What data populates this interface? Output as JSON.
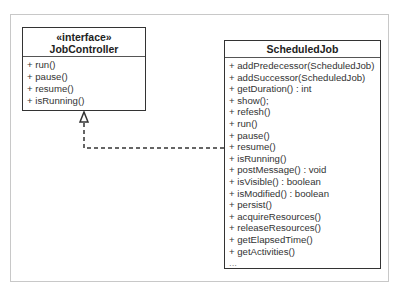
{
  "diagram": {
    "type": "UML class diagram",
    "relationship": "realization",
    "classes": [
      {
        "id": "jobcontroller",
        "stereotype": "«interface»",
        "name": "JobController",
        "operations": [
          "+ run()",
          "+ pause()",
          "+ resume()",
          "+ isRunning()"
        ]
      },
      {
        "id": "scheduledjob",
        "stereotype": "",
        "name": "ScheduledJob",
        "operations": [
          "+ addPredecessor(ScheduledJob)",
          "+ addSuccessor(ScheduledJob)",
          "+ getDuration() : int",
          "+ show();",
          "+ refesh()",
          "+ run()",
          "+ pause()",
          "+ resume()",
          "+ isRunning()",
          "+ postMessage() : void",
          "+ isVisible() : boolean",
          "+ isModified() : boolean",
          "+ persist()",
          "+ acquireResources()",
          "+ releaseResources()",
          "+ getElapsedTime()",
          "+ getActivities()",
          "..."
        ]
      }
    ],
    "edges": [
      {
        "from": "ScheduledJob",
        "to": "JobController",
        "style": "dashed",
        "arrowhead": "hollow-triangle"
      }
    ]
  }
}
